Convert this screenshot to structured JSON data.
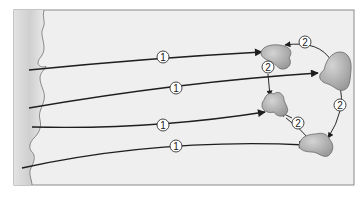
{
  "diagram": {
    "frame": {
      "x": 14,
      "y": 10,
      "width": 340,
      "height": 175,
      "background": "#efefef",
      "border": "#8a8a8a"
    },
    "left_region": {
      "fill_light": "#f4f4f4",
      "fill_dark": "#c8c8c8",
      "edge": "#6e6e6e"
    },
    "blob_color": "#b5b5b5",
    "blob_stroke": "#6a6a6a",
    "arrow_color": "#1e1e1e",
    "step1_label": "1",
    "step2_label": "2",
    "arrows_step1": [
      {
        "label": "1",
        "from": [
          29,
          70
        ],
        "to": [
          262,
          52
        ],
        "label_pos": [
          163,
          57
        ]
      },
      {
        "label": "1",
        "from": [
          29,
          108
        ],
        "to": [
          318,
          73
        ],
        "label_pos": [
          176,
          88
        ]
      },
      {
        "label": "1",
        "from": [
          32,
          127
        ],
        "to": [
          265,
          112
        ],
        "label_pos": [
          163,
          125
        ]
      },
      {
        "label": "1",
        "from": [
          22,
          168
        ],
        "to": [
          306,
          145
        ],
        "label_pos": [
          176,
          146
        ]
      }
    ],
    "arrows_step2": [
      {
        "label": "2",
        "label_pos": [
          305,
          42
        ]
      },
      {
        "label": "2",
        "label_pos": [
          268,
          67
        ]
      },
      {
        "label": "2",
        "label_pos": [
          340,
          105
        ]
      },
      {
        "label": "2",
        "label_pos": [
          298,
          123
        ]
      }
    ]
  }
}
